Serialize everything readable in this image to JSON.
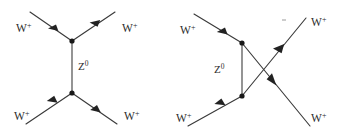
{
  "figure": {
    "background_color": "#ffffff",
    "line_color": "#3a3a3a",
    "propagator_color": "#7a7a7a",
    "vertex_color": "#181818",
    "width": 343,
    "height": 137
  },
  "diagrams": [
    {
      "id": "t-channel",
      "name": "t-channel Z0 exchange",
      "propagator": {
        "label_base": "Z",
        "label_sup": "0",
        "label_full": "Z⁰",
        "x1": 72,
        "y1": 41,
        "x2": 72,
        "y2": 93
      },
      "vertices": [
        {
          "name": "upper-vertex",
          "x": 72,
          "y": 41
        },
        {
          "name": "lower-vertex",
          "x": 72,
          "y": 93
        }
      ],
      "legs": [
        {
          "name": "incoming-upper-left",
          "label_base": "W",
          "label_sup": "+",
          "label_full": "W⁺",
          "label_x": 22,
          "label_y": 28,
          "x1": 30,
          "y1": 12,
          "x2": 72,
          "y2": 41,
          "arrow_t": 0.58,
          "direction": "incoming"
        },
        {
          "name": "outgoing-upper-right",
          "label_base": "W",
          "label_sup": "+",
          "label_full": "W⁺",
          "label_x": 122,
          "label_y": 28,
          "x1": 72,
          "y1": 41,
          "x2": 115,
          "y2": 12,
          "arrow_t": 0.6,
          "direction": "outgoing"
        },
        {
          "name": "incoming-lower-left",
          "label_base": "W",
          "label_sup": "+",
          "label_full": "W⁺",
          "label_x": 22,
          "label_y": 118,
          "x1": 26,
          "y1": 124,
          "x2": 72,
          "y2": 93,
          "arrow_t": 0.62,
          "direction": "incoming"
        },
        {
          "name": "outgoing-lower-right",
          "label_base": "W",
          "label_sup": "+",
          "label_full": "W⁺",
          "label_x": 122,
          "label_y": 118,
          "x1": 72,
          "y1": 93,
          "x2": 117,
          "y2": 124,
          "arrow_t": 0.58,
          "direction": "outgoing"
        }
      ]
    },
    {
      "id": "u-channel",
      "name": "u-channel Z0 exchange with crossed outgoing legs",
      "propagator": {
        "label_base": "Z",
        "label_sup": "0",
        "label_full": "Z⁰",
        "x1": 242,
        "y1": 43,
        "x2": 242,
        "y2": 96
      },
      "vertices": [
        {
          "name": "upper-vertex",
          "x": 242,
          "y": 43
        },
        {
          "name": "lower-vertex",
          "x": 242,
          "y": 96
        }
      ],
      "legs": [
        {
          "name": "incoming-upper-left",
          "label_base": "W",
          "label_sup": "+",
          "label_full": "W⁺",
          "label_x": 186,
          "label_y": 30,
          "x1": 194,
          "y1": 14,
          "x2": 242,
          "y2": 43,
          "arrow_t": 0.58,
          "direction": "incoming"
        },
        {
          "name": "incoming-lower-left",
          "label_base": "W",
          "label_sup": "+",
          "label_full": "W⁺",
          "label_x": 182,
          "label_y": 120,
          "x1": 188,
          "y1": 126,
          "x2": 242,
          "y2": 96,
          "arrow_t": 0.62,
          "direction": "incoming"
        },
        {
          "name": "outgoing-crossed-upper",
          "label_base": "W",
          "label_sup": "+",
          "label_full": "W⁺",
          "label_x": 311,
          "label_y": 26,
          "x1": 242,
          "y1": 96,
          "x2": 306,
          "y2": 18,
          "arrow_t": 0.6,
          "direction": "outgoing"
        },
        {
          "name": "outgoing-crossed-lower",
          "label_base": "W",
          "label_sup": "+",
          "label_full": "W⁺",
          "label_x": 311,
          "label_y": 120,
          "x1": 242,
          "y1": 43,
          "x2": 310,
          "y2": 126,
          "arrow_t": 0.43,
          "direction": "outgoing"
        }
      ],
      "tick": {
        "name": "stray-tick-mark",
        "x1": 282,
        "y1": 20,
        "x2": 286,
        "y2": 20
      }
    }
  ]
}
